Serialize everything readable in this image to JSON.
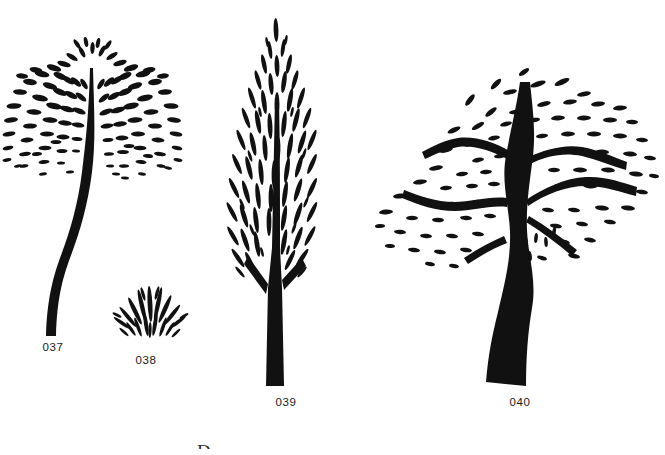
{
  "plate": {
    "width": 665,
    "height": 455,
    "background_color": "#ffffff",
    "ink_color": "#111111",
    "caption_color": "#1a1a1a",
    "medium": "black ink line drawing",
    "partial_bottom_mark": "D"
  },
  "figures": [
    {
      "id": "037",
      "caption": "037",
      "name": "weeping-willow-tree",
      "description": "Tall slender tree with a long S-curved tapering trunk and a rounded crown of radiating, downward-drooping strokes of short leaf dashes",
      "caption_x": 38,
      "caption_y": 341,
      "canopy_center_x": 92,
      "canopy_center_y": 62,
      "trunk_base_x": 48,
      "trunk_base_y": 336,
      "height_px": 320
    },
    {
      "id": "038",
      "caption": "038",
      "name": "low-grass-shrub",
      "description": "Small low fan-shaped clump of radiating grass-like blade strokes",
      "caption_x": 131,
      "caption_y": 354,
      "center_x": 148,
      "base_y": 338,
      "height_px": 50
    },
    {
      "id": "039",
      "caption": "039",
      "name": "cypress-poplar-tree",
      "description": "Narrow columnar conifer with a pointed top, dense vertical leaf dashes and a straight thick vertical trunk",
      "caption_x": 270,
      "caption_y": 396,
      "center_x": 275,
      "top_y": 14,
      "trunk_base_y": 386,
      "height_px": 372
    },
    {
      "id": "040",
      "caption": "040",
      "name": "broad-spreading-tree",
      "description": "Broad wind-swept tree with a thick wavy trunk, long horizontal wavy branches and a wide flat canopy of small horizontal leaf dashes",
      "caption_x": 503,
      "caption_y": 396,
      "trunk_base_x": 520,
      "trunk_base_y": 388,
      "canopy_left_x": 384,
      "canopy_right_x": 650,
      "height_px": 320
    }
  ]
}
